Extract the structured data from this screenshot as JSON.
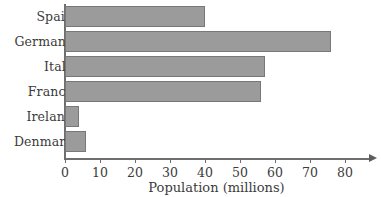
{
  "chart_data": {
    "type": "bar",
    "orientation": "horizontal",
    "title": "",
    "xlabel": "Population (millions)",
    "ylabel": "",
    "categories": [
      "Spain",
      "Germany",
      "Italy",
      "France",
      "Ireland",
      "Denmark"
    ],
    "values": [
      40,
      76,
      57,
      56,
      4,
      6
    ],
    "xlim": [
      0,
      80
    ],
    "xticks": [
      0,
      10,
      20,
      30,
      40,
      50,
      60,
      70,
      80
    ],
    "xtick_labels": [
      "0",
      "10",
      "20",
      "30",
      "40",
      "50",
      "60",
      "70",
      "80"
    ],
    "grid": false,
    "legend": null,
    "bar_fill_color": "#9b9b9b",
    "bar_edge_color": "#787878",
    "axis_color": "#6e6e6e",
    "text_color": "#3b3b3b",
    "background_color": "#ffffff",
    "axis_arrow": true
  }
}
